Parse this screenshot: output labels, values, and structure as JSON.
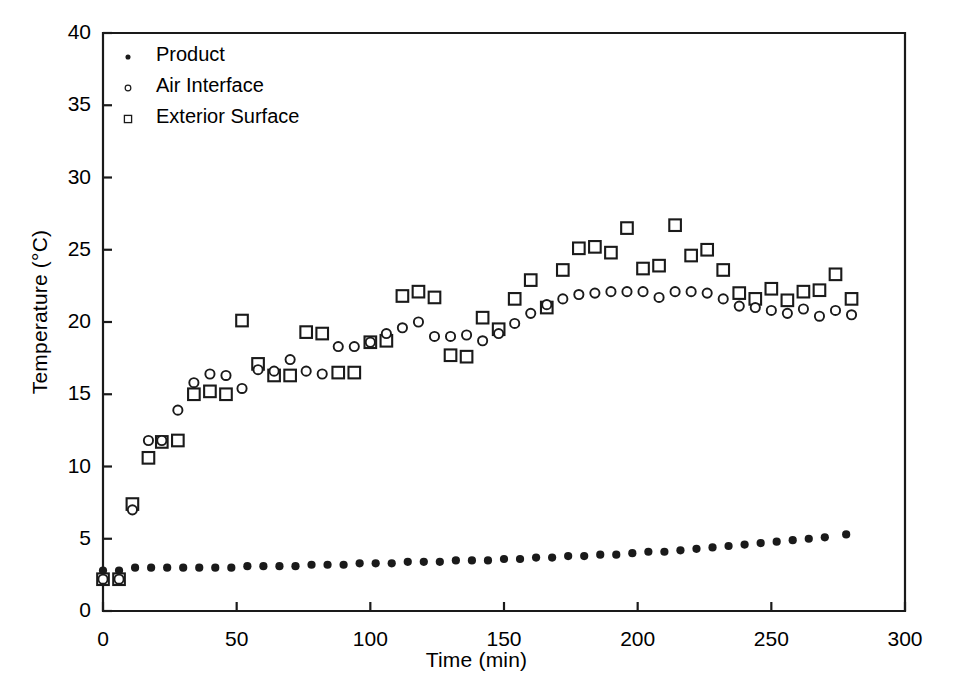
{
  "chart_data": {
    "type": "scatter",
    "title": "",
    "xlabel": "Time (min)",
    "ylabel": "Temperature (°C)",
    "xlim": [
      0,
      300
    ],
    "ylim": [
      0,
      40
    ],
    "xticks": [
      0,
      50,
      100,
      150,
      200,
      250,
      300
    ],
    "yticks": [
      0,
      5,
      10,
      15,
      20,
      25,
      30,
      35,
      40
    ],
    "grid": false,
    "legend_position": "top-left",
    "legend": [
      "Product",
      "Air Interface",
      "Exterior Surface"
    ],
    "markers": {
      "Product": "filled-circle",
      "Air Interface": "open-circle",
      "Exterior Surface": "open-square"
    },
    "series": [
      {
        "name": "Product",
        "marker": "filled-circle",
        "x": [
          0,
          6,
          12,
          18,
          24,
          30,
          36,
          42,
          48,
          54,
          60,
          66,
          72,
          78,
          84,
          90,
          96,
          102,
          108,
          114,
          120,
          126,
          132,
          138,
          144,
          150,
          156,
          162,
          168,
          174,
          180,
          186,
          192,
          198,
          204,
          210,
          216,
          222,
          228,
          234,
          240,
          246,
          252,
          258,
          264,
          270,
          278
        ],
        "y": [
          2.8,
          2.8,
          3.0,
          3.0,
          3.0,
          3.0,
          3.0,
          3.0,
          3.0,
          3.1,
          3.1,
          3.1,
          3.1,
          3.2,
          3.2,
          3.2,
          3.3,
          3.3,
          3.3,
          3.4,
          3.4,
          3.4,
          3.5,
          3.5,
          3.5,
          3.6,
          3.6,
          3.7,
          3.7,
          3.8,
          3.8,
          3.9,
          3.9,
          4.0,
          4.1,
          4.1,
          4.2,
          4.3,
          4.4,
          4.5,
          4.6,
          4.7,
          4.8,
          4.9,
          5.0,
          5.1,
          5.3
        ]
      },
      {
        "name": "Air Interface",
        "marker": "open-circle",
        "x": [
          0,
          6,
          11,
          17,
          22,
          28,
          34,
          40,
          46,
          52,
          58,
          64,
          70,
          76,
          82,
          88,
          94,
          100,
          106,
          112,
          118,
          124,
          130,
          136,
          142,
          148,
          154,
          160,
          166,
          172,
          178,
          184,
          190,
          196,
          202,
          208,
          214,
          220,
          226,
          232,
          238,
          244,
          250,
          256,
          262,
          268,
          274,
          280
        ],
        "y": [
          2.2,
          2.2,
          7.0,
          11.8,
          11.8,
          13.9,
          15.8,
          16.4,
          16.3,
          15.4,
          16.7,
          16.6,
          17.4,
          16.6,
          16.4,
          18.3,
          18.3,
          18.6,
          19.2,
          19.6,
          20.0,
          19.0,
          19.0,
          19.1,
          18.7,
          19.2,
          19.9,
          20.6,
          21.2,
          21.6,
          21.9,
          22.0,
          22.1,
          22.1,
          22.1,
          21.7,
          22.1,
          22.1,
          22.0,
          21.6,
          21.1,
          21.0,
          20.8,
          20.6,
          20.9,
          20.4,
          20.8,
          20.5
        ]
      },
      {
        "name": "Exterior Surface",
        "marker": "open-square",
        "x": [
          0,
          6,
          11,
          17,
          22,
          28,
          34,
          40,
          46,
          52,
          58,
          64,
          70,
          76,
          82,
          88,
          94,
          100,
          106,
          112,
          118,
          124,
          130,
          136,
          142,
          148,
          154,
          160,
          166,
          172,
          178,
          184,
          190,
          196,
          202,
          208,
          214,
          220,
          226,
          232,
          238,
          244,
          250,
          256,
          262,
          268,
          274,
          280
        ],
        "y": [
          2.2,
          2.2,
          7.4,
          10.6,
          11.7,
          11.8,
          15.0,
          15.2,
          15.0,
          20.1,
          17.1,
          16.3,
          16.3,
          19.3,
          19.2,
          16.5,
          16.5,
          18.6,
          18.7,
          21.8,
          22.1,
          21.7,
          17.7,
          17.6,
          20.3,
          19.5,
          21.6,
          22.9,
          21.0,
          23.6,
          25.1,
          25.2,
          24.8,
          26.5,
          23.7,
          23.9,
          26.7,
          24.6,
          25.0,
          23.6,
          22.0,
          21.6,
          22.3,
          21.5,
          22.1,
          22.2,
          23.3,
          21.6
        ]
      }
    ]
  },
  "axes": {
    "x_tick_labels": [
      "0",
      "50",
      "100",
      "150",
      "200",
      "250",
      "300"
    ],
    "y_tick_labels": [
      "0",
      "5",
      "10",
      "15",
      "20",
      "25",
      "30",
      "35",
      "40"
    ]
  },
  "legend": {
    "items": [
      {
        "label": "Product",
        "marker": "filled-circle"
      },
      {
        "label": "Air Interface",
        "marker": "open-circle"
      },
      {
        "label": "Exterior Surface",
        "marker": "open-square"
      }
    ]
  },
  "style": {
    "ink": "#1a1a1a",
    "background": "#ffffff"
  }
}
